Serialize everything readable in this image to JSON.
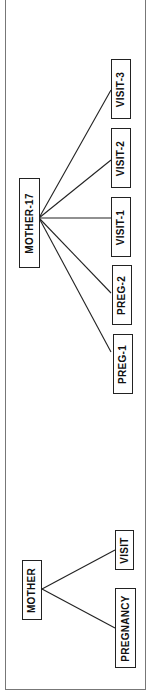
{
  "diagram": {
    "type": "tree",
    "orientation": "rotated-90-ccw",
    "schema": {
      "root": {
        "label": "MOTHER"
      },
      "children": [
        {
          "label": "PREGNANCY"
        },
        {
          "label": "VISIT"
        }
      ]
    },
    "instance": {
      "root": {
        "label": "MOTHER-17"
      },
      "children": [
        {
          "label": "PREG-1"
        },
        {
          "label": "PREG-2"
        },
        {
          "label": "VISIT-1"
        },
        {
          "label": "VISIT-2"
        },
        {
          "label": "VISIT-3"
        }
      ]
    },
    "colors": {
      "line": "#222222",
      "frame": "#777777",
      "background": "#ffffff"
    }
  }
}
